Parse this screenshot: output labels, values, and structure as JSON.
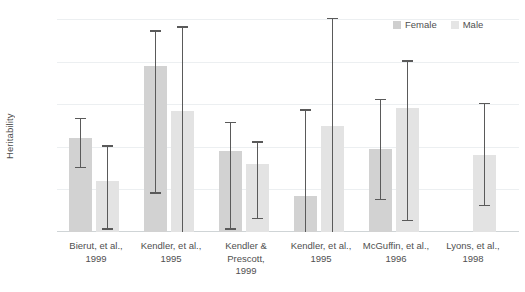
{
  "chart_data": {
    "type": "bar",
    "title": "",
    "subtitle": "",
    "xlabel": "",
    "ylabel": "Heritability",
    "ylim": [
      0,
      100
    ],
    "yticks": [
      0,
      20,
      40,
      60,
      80,
      100
    ],
    "grid": true,
    "legend_position": "top-right",
    "legend": [
      "Female",
      "Male"
    ],
    "categories": [
      "Bierut, et al., 1999",
      "Kendler, et al., 1995",
      "Kendler & Prescott, 1999",
      "Kendler, et al., 1995",
      "McGuffin, et al., 1996",
      "Lyons, et al., 1998"
    ],
    "category_lines": [
      [
        "Bierut, et al.,",
        "1999"
      ],
      [
        "Kendler, et al.,",
        "1995"
      ],
      [
        "Kendler &",
        "Prescott,",
        "1999"
      ],
      [
        "Kendler, et al.,",
        "1995"
      ],
      [
        "McGuffin, et al.,",
        "1996"
      ],
      [
        "Lyons, et al.,",
        "1998"
      ]
    ],
    "series": [
      {
        "name": "Female",
        "color": "#d2d2d2",
        "values": [
          44,
          78,
          38,
          17,
          39,
          null
        ],
        "ci_low": [
          30,
          18,
          1,
          0,
          15,
          null
        ],
        "ci_high": [
          53,
          94,
          51,
          57,
          62,
          null
        ]
      },
      {
        "name": "Male",
        "color": "#e3e3e3",
        "values": [
          24,
          57,
          32,
          50,
          58,
          36
        ],
        "ci_low": [
          1,
          0,
          6,
          0,
          5,
          12
        ],
        "ci_high": [
          40,
          96,
          42,
          100,
          80,
          60
        ]
      }
    ]
  },
  "colors": {
    "female": "#d2d2d2",
    "male": "#e3e3e3",
    "error_bar": "#5a5a5a",
    "gridline": "#eceff1",
    "axis_text": "#4f4f4f",
    "background": "#ffffff"
  },
  "yticks": {
    "t0": "0",
    "t20": "20",
    "t40": "40",
    "t60": "60",
    "t80": "80",
    "t100": "100"
  }
}
